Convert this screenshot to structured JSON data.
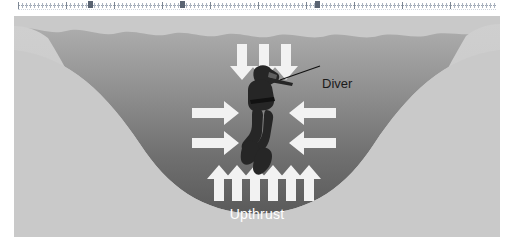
{
  "ruler": {
    "name": "document-ruler",
    "tab_stops": [
      88,
      180,
      315
    ],
    "unit_major_every": 48,
    "left_margin_px": 18,
    "right_margin_px": 18
  },
  "figure": {
    "background_color": "#c9c9c9",
    "water": {
      "surface_style": "wavy",
      "color_top": "#a8a8a8",
      "color_bottom": "#5e5e5e",
      "shore_color_left": "#c2c2c2",
      "shore_color_right": "#c7c7c7"
    },
    "diver": {
      "name": "diver-silhouette",
      "color": "#2b2b2b",
      "label": "Diver"
    },
    "labels": {
      "diver": "Diver",
      "upthrust": "Upthrust"
    },
    "force_arrows": [
      {
        "name": "weight-arrows-down",
        "direction": "down",
        "count": 3,
        "color": "#f2f2f2"
      },
      {
        "name": "pressure-arrows-right",
        "direction": "right",
        "count": 2,
        "color": "#f2f2f2"
      },
      {
        "name": "pressure-arrows-left",
        "direction": "left",
        "count": 2,
        "color": "#f2f2f2"
      },
      {
        "name": "upthrust-arrows-up",
        "direction": "up",
        "count": 6,
        "color": "#f2f2f2"
      }
    ],
    "leader_line": {
      "name": "diver-leader-line",
      "color": "#111111"
    }
  },
  "chart_data": {
    "type": "diagram",
    "annotations": [
      "Diver",
      "Upthrust"
    ],
    "series": [
      {
        "name": "Downward force (weight)",
        "direction": "down",
        "arrow_count": 3
      },
      {
        "name": "Sideways pressure from left",
        "direction": "right",
        "arrow_count": 2
      },
      {
        "name": "Sideways pressure from right",
        "direction": "left",
        "arrow_count": 2
      },
      {
        "name": "Upthrust (buoyancy)",
        "direction": "up",
        "arrow_count": 6
      }
    ],
    "xlabel": "",
    "ylabel": ""
  }
}
